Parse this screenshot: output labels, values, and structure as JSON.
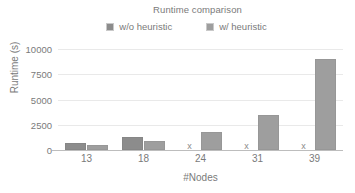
{
  "chart_data": {
    "type": "bar",
    "title": "Runtime comparison",
    "xlabel": "#Nodes",
    "ylabel": "Runtime (s)",
    "categories": [
      "13",
      "18",
      "24",
      "31",
      "39"
    ],
    "series": [
      {
        "name": "w/o heuristic",
        "color": "#8c8c8c",
        "values": [
          700,
          1300,
          null,
          null,
          null
        ],
        "missing_marker": "x"
      },
      {
        "name": "w/ heuristic",
        "color": "#9e9e9e",
        "values": [
          500,
          850,
          1800,
          3500,
          9000
        ],
        "missing_marker": "x"
      }
    ],
    "ylim": [
      0,
      10000
    ],
    "yticks": [
      "0",
      "2500",
      "5000",
      "7500",
      "10000"
    ],
    "ytick_values": [
      0,
      2500,
      5000,
      7500,
      10000
    ],
    "grid": true,
    "legend_position": "top"
  }
}
